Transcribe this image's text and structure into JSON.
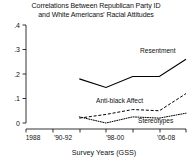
{
  "chart_data": {
    "type": "line",
    "title": "Correlations Between Republican Party ID and White Americans' Racial Attitudes",
    "title_line1": "Correlations Between Republican Party ID",
    "title_line2": "and White Americans' Racial Attitudes",
    "xlabel": "Survey Years (GSS)",
    "ylabel": "",
    "ylim": [
      0,
      0.4
    ],
    "ytick_labels": [
      ".4",
      ".3",
      ".2",
      ".1",
      "0"
    ],
    "ytick_values": [
      0.4,
      0.3,
      0.2,
      0.1,
      0
    ],
    "xtick_labels": [
      "1988",
      "'90-92",
      "'98-00",
      "'06-08"
    ],
    "x_categories": [
      "1988",
      "'90-92",
      "'94-96",
      "'98-00",
      "'02-04",
      "'06-08",
      "'10-12"
    ],
    "grid": false,
    "legend_position": "inline-annotations",
    "series": [
      {
        "name": "Resentment",
        "style": "solid",
        "x": [
          "'94-96",
          "'98-00",
          "'02-04",
          "'06-08",
          "'10-12"
        ],
        "values": [
          0.18,
          0.145,
          0.19,
          0.19,
          0.26
        ]
      },
      {
        "name": "Anti-black Affect",
        "style": "dashed",
        "x": [
          "'94-96",
          "'98-00",
          "'02-04",
          "'06-08",
          "'10-12"
        ],
        "values": [
          0.02,
          0.035,
          0.055,
          0.05,
          0.12
        ]
      },
      {
        "name": "Stereotypes",
        "style": "dotted",
        "x": [
          "'94-96",
          "'98-00",
          "'02-04",
          "'06-08",
          "'10-12"
        ],
        "values": [
          0.025,
          0.0,
          0.025,
          0.02,
          0.04
        ]
      }
    ],
    "annotations": [
      {
        "text": "Resentment",
        "x": 0.76,
        "y": 0.255
      },
      {
        "text": "Anti-black Affect",
        "x": 0.56,
        "y": 0.115
      },
      {
        "text": "Stereotypes",
        "x": 0.79,
        "y": 0.015
      }
    ]
  },
  "colors": {
    "background": "#ffffff",
    "ink": "#111111",
    "axis": "#000000"
  }
}
